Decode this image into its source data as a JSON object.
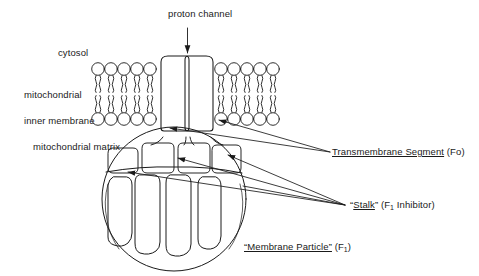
{
  "figure": {
    "background_color": "#ffffff",
    "stroke_color": "#1a1a1a",
    "text_color": "#1a1a1a"
  },
  "labels": {
    "proton_channel": "proton channel",
    "cytosol": "cytosol",
    "inner_membrane_line1": "mitochondrial",
    "inner_membrane_line2": "inner membrane",
    "matrix": "mitochondrial matrix",
    "transmembrane_underlined": "Transmembrane Segment",
    "transmembrane_suffix": " (Fo)",
    "stalk_quote_open": "“",
    "stalk_underlined": "Stalk",
    "stalk_quote_close": "”",
    "stalk_suffix_pre": " (F",
    "stalk_sub": "1",
    "stalk_suffix_post": " Inhibitor)",
    "membrane_particle_underlined": "“Membrane Particle”",
    "membrane_particle_suffix_pre": " (F",
    "membrane_particle_sub": "1",
    "membrane_particle_suffix_post": ")"
  },
  "structure": {
    "bilayer_left_lipid_count": 5,
    "bilayer_right_lipid_count": 5,
    "fo_subunit_count": 2,
    "stalk_lobe_count": 4,
    "f1_subunit_count": 4,
    "arrow_count": 5
  }
}
